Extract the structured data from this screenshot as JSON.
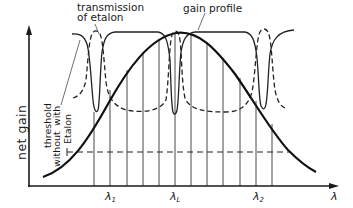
{
  "figure": {
    "y_axis_label": "net gain",
    "x_axis_label": "λ",
    "labels": {
      "transmission_line1": "transmission",
      "transmission_line2": "of etalon",
      "gain_profile": "gain profile",
      "threshold": "threshold",
      "without": "without",
      "with": "with",
      "etalon": "Etalon"
    },
    "wavelength_marks": [
      {
        "symbol": "λ",
        "sub": "1"
      },
      {
        "symbol": "λ",
        "sub": "L"
      },
      {
        "symbol": "λ",
        "sub": "2"
      }
    ]
  },
  "curves": {
    "gain_profile": "solid bell-shaped curve peaking near λL",
    "transmission_of_etalon_with": "solid curve with narrow dips at λ1-side, λL, λ2-side",
    "threshold_with_etalon": "dashed curve",
    "threshold_without_etalon": "horizontal dashed line"
  },
  "longitudinal_modes": {
    "count": 12,
    "description": "equally spaced vertical lines from axis up to gain profile"
  }
}
